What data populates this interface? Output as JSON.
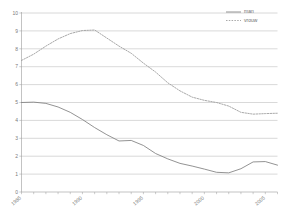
{
  "chart_data": {
    "type": "line",
    "title": "",
    "subtitle": "",
    "xlabel": "",
    "ylabel": "",
    "xlim": [
      1985,
      2006
    ],
    "ylim": [
      0,
      10
    ],
    "grid": true,
    "legend_position": "top-right",
    "y_ticks": [
      "10",
      "9",
      "8",
      "7",
      "6",
      "5",
      "4",
      "3",
      "2",
      "1",
      "0"
    ],
    "y_tick_values": [
      10,
      9,
      8,
      7,
      6,
      5,
      4,
      3,
      2,
      1,
      0
    ],
    "x_ticks": [
      "1985",
      "1990",
      "1995",
      "2000",
      "2005"
    ],
    "x_tick_values": [
      1985,
      1990,
      1995,
      2000,
      2005
    ],
    "x": [
      1985,
      1986,
      1987,
      1988,
      1989,
      1990,
      1991,
      1992,
      1993,
      1994,
      1995,
      1996,
      1997,
      1998,
      1999,
      2000,
      2001,
      2002,
      2003,
      2004,
      2005,
      2006
    ],
    "series": [
      {
        "name": "man",
        "style": "solid",
        "color": "#808080",
        "values": [
          5.0,
          5.02,
          4.95,
          4.75,
          4.45,
          4.05,
          3.6,
          3.2,
          2.85,
          2.88,
          2.6,
          2.15,
          1.85,
          1.6,
          1.45,
          1.28,
          1.1,
          1.07,
          1.3,
          1.68,
          1.7,
          1.5
        ]
      },
      {
        "name": "vrouw",
        "style": "dotted",
        "color": "#9a9a9a",
        "values": [
          7.35,
          7.7,
          8.15,
          8.55,
          8.85,
          9.02,
          9.05,
          8.6,
          8.15,
          7.75,
          7.2,
          6.7,
          6.1,
          5.65,
          5.3,
          5.12,
          5.0,
          4.8,
          4.45,
          4.35,
          4.38,
          4.4
        ]
      }
    ]
  },
  "legend": {
    "entries": [
      {
        "label": "man"
      },
      {
        "label": "vrouw"
      }
    ]
  }
}
